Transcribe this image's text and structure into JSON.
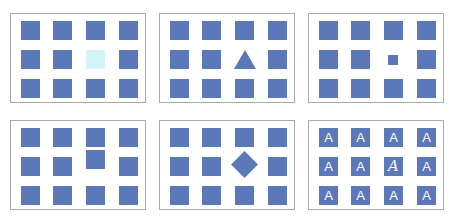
{
  "figure": {
    "colors": {
      "item": "#5b79b8",
      "pale_item": "#d3f3f6",
      "border": "#a9a9a9",
      "background": "#ffffff"
    },
    "grid": {
      "columns": 4,
      "rows": 3
    },
    "panels": [
      {
        "id": "color",
        "feature": "color",
        "odd_item": {
          "row": 1,
          "col": 2,
          "shape": "square",
          "color": "#d3f3f6"
        }
      },
      {
        "id": "shape",
        "feature": "shape",
        "odd_item": {
          "row": 1,
          "col": 2,
          "shape": "triangle"
        }
      },
      {
        "id": "size",
        "feature": "size",
        "odd_item": {
          "row": 1,
          "col": 2,
          "shape": "small-square"
        }
      },
      {
        "id": "position",
        "feature": "position",
        "odd_item": {
          "row": 1,
          "col": 2,
          "shape": "square",
          "offset": "up"
        }
      },
      {
        "id": "orientation",
        "feature": "orientation",
        "odd_item": {
          "row": 1,
          "col": 2,
          "shape": "diamond"
        }
      },
      {
        "id": "typeface",
        "feature": "typeface",
        "odd_item": {
          "row": 1,
          "col": 2,
          "shape": "square",
          "glyph": "A",
          "style": "italic"
        }
      }
    ],
    "glyphs": {
      "letter": "A",
      "row0": [
        "A",
        "A",
        "A",
        "A"
      ],
      "row1": [
        "A",
        "A",
        "A",
        "A"
      ],
      "row2": [
        "A",
        "A",
        "A",
        "A"
      ]
    }
  }
}
